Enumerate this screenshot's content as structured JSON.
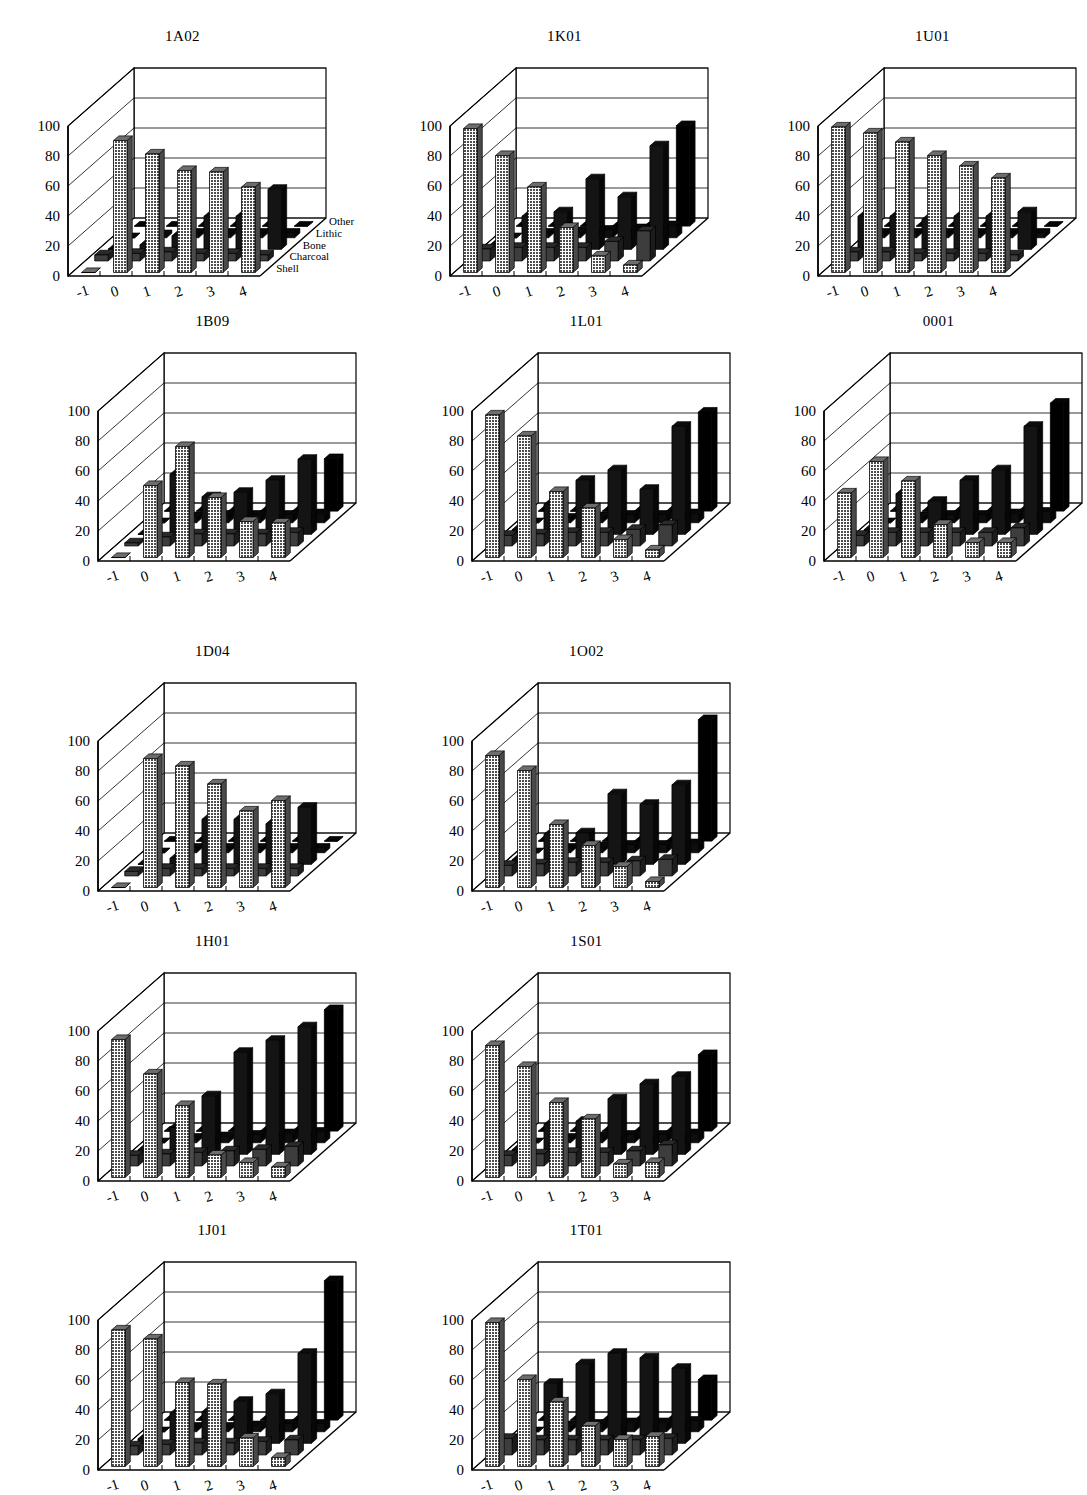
{
  "figure": {
    "kind": "small-multiples-3d-bar-figure",
    "columns": 3,
    "rows": 5,
    "background": "#ffffff",
    "ink": "#000000"
  },
  "axes": {
    "y_ticks": [
      "0",
      "20",
      "40",
      "60",
      "80",
      "100"
    ],
    "y_values": [
      0,
      20,
      40,
      60,
      80,
      100
    ],
    "x_ticks": [
      "-1",
      "0",
      "1",
      "2",
      "3",
      "4"
    ],
    "x_values": [
      -1,
      0,
      1,
      2,
      3,
      4
    ],
    "series_labels": [
      "Other",
      "Lithic",
      "Bone",
      "Charcoal",
      "Shell"
    ],
    "series_order_front_to_back": [
      "Shell",
      "Charcoal",
      "Bone",
      "Lithic",
      "Other"
    ]
  },
  "legend": {
    "visible_on_panel": "1A02",
    "labels": [
      "Other",
      "Lithic",
      "Bone",
      "Charcoal",
      "Shell"
    ]
  },
  "colors": {
    "shell": "#808080",
    "charcoal": "#404040",
    "bone": "#1a1a1a",
    "lithic": "#111111",
    "other": "#000000",
    "panel_line": "#000000",
    "grid_line": "#000000"
  },
  "chart_data": [
    {
      "type": "bar",
      "title": "1A02",
      "xlabel": "",
      "ylabel": "",
      "ylim": [
        0,
        100
      ],
      "categories": [
        "-1",
        "0",
        "1",
        "2",
        "3",
        "4"
      ],
      "series": [
        {
          "name": "Shell",
          "values": [
            0,
            88,
            79,
            68,
            67,
            57
          ]
        },
        {
          "name": "Charcoal",
          "values": [
            4,
            5,
            6,
            5,
            5,
            4
          ]
        },
        {
          "name": "Bone",
          "values": [
            0,
            3,
            9,
            22,
            22,
            40
          ]
        },
        {
          "name": "Lithic",
          "values": [
            0,
            2,
            3,
            3,
            3,
            3
          ]
        },
        {
          "name": "Other",
          "values": [
            0,
            0,
            0,
            0,
            0,
            0
          ]
        }
      ]
    },
    {
      "type": "bar",
      "title": "1K01",
      "xlabel": "",
      "ylabel": "",
      "ylim": [
        0,
        100
      ],
      "categories": [
        "-1",
        "0",
        "1",
        "2",
        "3",
        "4"
      ],
      "series": [
        {
          "name": "Shell",
          "values": [
            96,
            78,
            57,
            30,
            11,
            5
          ]
        },
        {
          "name": "Charcoal",
          "values": [
            8,
            9,
            9,
            9,
            13,
            20
          ]
        },
        {
          "name": "Bone",
          "values": [
            3,
            22,
            25,
            47,
            35,
            69
          ]
        },
        {
          "name": "Lithic",
          "values": [
            0,
            3,
            4,
            5,
            6,
            8
          ]
        },
        {
          "name": "Other",
          "values": [
            0,
            0,
            0,
            0,
            0,
            67
          ]
        }
      ]
    },
    {
      "type": "bar",
      "title": "1U01",
      "xlabel": "",
      "ylabel": "",
      "ylim": [
        0,
        100
      ],
      "categories": [
        "-1",
        "0",
        "1",
        "2",
        "3",
        "4"
      ],
      "series": [
        {
          "name": "Shell",
          "values": [
            97,
            93,
            87,
            78,
            71,
            63
          ]
        },
        {
          "name": "Charcoal",
          "values": [
            6,
            6,
            5,
            5,
            5,
            4
          ]
        },
        {
          "name": "Bone",
          "values": [
            22,
            22,
            20,
            22,
            22,
            25
          ]
        },
        {
          "name": "Lithic",
          "values": [
            3,
            3,
            3,
            3,
            3,
            3
          ]
        },
        {
          "name": "Other",
          "values": [
            0,
            0,
            0,
            0,
            0,
            0
          ]
        }
      ]
    },
    {
      "type": "bar",
      "title": "1B09",
      "xlabel": "",
      "ylabel": "",
      "ylim": [
        0,
        100
      ],
      "categories": [
        "-1",
        "0",
        "1",
        "2",
        "3",
        "4"
      ],
      "series": [
        {
          "name": "Shell",
          "values": [
            0,
            48,
            74,
            40,
            24,
            23
          ]
        },
        {
          "name": "Charcoal",
          "values": [
            2,
            6,
            8,
            8,
            8,
            9
          ]
        },
        {
          "name": "Bone",
          "values": [
            0,
            40,
            25,
            28,
            36,
            50
          ]
        },
        {
          "name": "Lithic",
          "values": [
            0,
            4,
            5,
            5,
            5,
            6
          ]
        },
        {
          "name": "Other",
          "values": [
            0,
            0,
            0,
            0,
            0,
            35
          ]
        }
      ]
    },
    {
      "type": "bar",
      "title": "1L01",
      "xlabel": "",
      "ylabel": "",
      "ylim": [
        0,
        100
      ],
      "categories": [
        "-1",
        "0",
        "1",
        "2",
        "3",
        "4"
      ],
      "series": [
        {
          "name": "Shell",
          "values": [
            95,
            81,
            44,
            33,
            12,
            5
          ]
        },
        {
          "name": "Charcoal",
          "values": [
            7,
            8,
            9,
            9,
            11,
            14
          ]
        },
        {
          "name": "Bone",
          "values": [
            3,
            20,
            36,
            43,
            30,
            72
          ]
        },
        {
          "name": "Lithic",
          "values": [
            0,
            3,
            4,
            5,
            5,
            6
          ]
        },
        {
          "name": "Other",
          "values": [
            0,
            0,
            0,
            0,
            0,
            66
          ]
        }
      ]
    },
    {
      "type": "bar",
      "title": "0001",
      "xlabel": "",
      "ylabel": "",
      "ylim": [
        0,
        100
      ],
      "categories": [
        "-1",
        "0",
        "1",
        "2",
        "3",
        "4"
      ],
      "series": [
        {
          "name": "Shell",
          "values": [
            43,
            64,
            51,
            22,
            10,
            10
          ]
        },
        {
          "name": "Charcoal",
          "values": [
            7,
            9,
            9,
            9,
            9,
            12
          ]
        },
        {
          "name": "Bone",
          "values": [
            3,
            27,
            22,
            36,
            43,
            72
          ]
        },
        {
          "name": "Lithic",
          "values": [
            0,
            4,
            5,
            5,
            6,
            7
          ]
        },
        {
          "name": "Other",
          "values": [
            0,
            0,
            0,
            0,
            0,
            72
          ]
        }
      ]
    },
    {
      "type": "bar",
      "title": "1D04",
      "xlabel": "",
      "ylabel": "",
      "ylim": [
        0,
        100
      ],
      "categories": [
        "-1",
        "0",
        "1",
        "2",
        "3",
        "4"
      ],
      "series": [
        {
          "name": "Shell",
          "values": [
            0,
            86,
            81,
            69,
            51,
            58
          ]
        },
        {
          "name": "Charcoal",
          "values": [
            3,
            5,
            5,
            5,
            5,
            5
          ]
        },
        {
          "name": "Bone",
          "values": [
            0,
            4,
            30,
            30,
            27,
            38
          ]
        },
        {
          "name": "Lithic",
          "values": [
            0,
            3,
            3,
            3,
            3,
            3
          ]
        },
        {
          "name": "Other",
          "values": [
            0,
            0,
            0,
            0,
            0,
            0
          ]
        }
      ]
    },
    {
      "type": "bar",
      "title": "1O02",
      "xlabel": "",
      "ylabel": "",
      "ylim": [
        0,
        100
      ],
      "categories": [
        "-1",
        "0",
        "1",
        "2",
        "3",
        "4"
      ],
      "series": [
        {
          "name": "Shell",
          "values": [
            88,
            78,
            42,
            28,
            14,
            4
          ]
        },
        {
          "name": "Charcoal",
          "values": [
            7,
            8,
            9,
            9,
            10,
            11
          ]
        },
        {
          "name": "Bone",
          "values": [
            3,
            20,
            21,
            47,
            40,
            53
          ]
        },
        {
          "name": "Lithic",
          "values": [
            0,
            3,
            4,
            5,
            5,
            6
          ]
        },
        {
          "name": "Other",
          "values": [
            0,
            0,
            0,
            0,
            0,
            81
          ]
        }
      ]
    },
    {
      "type": "bar",
      "title": "1H01",
      "xlabel": "",
      "ylabel": "",
      "ylim": [
        0,
        100
      ],
      "categories": [
        "-1",
        "0",
        "1",
        "2",
        "3",
        "4"
      ],
      "series": [
        {
          "name": "Shell",
          "values": [
            92,
            69,
            48,
            15,
            10,
            7
          ]
        },
        {
          "name": "Charcoal",
          "values": [
            7,
            8,
            9,
            10,
            11,
            13
          ]
        },
        {
          "name": "Bone",
          "values": [
            3,
            18,
            39,
            68,
            76,
            85
          ]
        },
        {
          "name": "Lithic",
          "values": [
            0,
            3,
            4,
            5,
            6,
            7
          ]
        },
        {
          "name": "Other",
          "values": [
            0,
            0,
            0,
            0,
            0,
            81
          ]
        }
      ]
    },
    {
      "type": "bar",
      "title": "1S01",
      "xlabel": "",
      "ylabel": "",
      "ylim": [
        0,
        100
      ],
      "categories": [
        "-1",
        "0",
        "1",
        "2",
        "3",
        "4"
      ],
      "series": [
        {
          "name": "Shell",
          "values": [
            88,
            74,
            50,
            39,
            9,
            10
          ]
        },
        {
          "name": "Charcoal",
          "values": [
            7,
            8,
            9,
            9,
            10,
            14
          ]
        },
        {
          "name": "Bone",
          "values": [
            3,
            20,
            22,
            37,
            47,
            52
          ]
        },
        {
          "name": "Lithic",
          "values": [
            0,
            3,
            4,
            5,
            5,
            6
          ]
        },
        {
          "name": "Other",
          "values": [
            0,
            0,
            0,
            0,
            0,
            51
          ]
        }
      ]
    },
    {
      "type": "bar",
      "title": "1J01",
      "xlabel": "",
      "ylabel": "",
      "ylim": [
        0,
        100
      ],
      "categories": [
        "-1",
        "0",
        "1",
        "2",
        "3",
        "4"
      ],
      "series": [
        {
          "name": "Shell",
          "values": [
            91,
            85,
            56,
            55,
            19,
            6
          ]
        },
        {
          "name": "Charcoal",
          "values": [
            6,
            7,
            8,
            8,
            9,
            10
          ]
        },
        {
          "name": "Bone",
          "values": [
            3,
            20,
            21,
            28,
            33,
            60
          ]
        },
        {
          "name": "Lithic",
          "values": [
            0,
            3,
            3,
            4,
            5,
            5
          ]
        },
        {
          "name": "Other",
          "values": [
            0,
            0,
            0,
            0,
            0,
            93
          ]
        }
      ]
    },
    {
      "type": "bar",
      "title": "1T01",
      "xlabel": "",
      "ylabel": "",
      "ylim": [
        0,
        100
      ],
      "categories": [
        "-1",
        "0",
        "1",
        "2",
        "3",
        "4"
      ],
      "series": [
        {
          "name": "Shell",
          "values": [
            96,
            58,
            43,
            27,
            18,
            20
          ]
        },
        {
          "name": "Charcoal",
          "values": [
            11,
            10,
            10,
            10,
            10,
            11
          ]
        },
        {
          "name": "Bone",
          "values": [
            3,
            40,
            53,
            60,
            57,
            50
          ]
        },
        {
          "name": "Lithic",
          "values": [
            0,
            4,
            5,
            6,
            6,
            7
          ]
        },
        {
          "name": "Other",
          "values": [
            0,
            0,
            0,
            0,
            0,
            27
          ]
        }
      ]
    }
  ],
  "panel_positions": [
    {
      "title": "1A02",
      "left": 10,
      "top": 28,
      "legend": true
    },
    {
      "title": "1K01",
      "left": 392,
      "top": 28,
      "legend": false
    },
    {
      "title": "1U01",
      "left": 760,
      "top": 28,
      "legend": false
    },
    {
      "title": "1B09",
      "left": 40,
      "top": 313,
      "legend": false
    },
    {
      "title": "1L01",
      "left": 414,
      "top": 313,
      "legend": false
    },
    {
      "title": "0001",
      "left": 766,
      "top": 313,
      "legend": false
    },
    {
      "title": "1D04",
      "left": 40,
      "top": 643,
      "legend": false
    },
    {
      "title": "1O02",
      "left": 414,
      "top": 643,
      "legend": false
    },
    {
      "title": "1H01",
      "left": 40,
      "top": 933,
      "legend": false
    },
    {
      "title": "1S01",
      "left": 414,
      "top": 933,
      "legend": false
    },
    {
      "title": "1J01",
      "left": 40,
      "top": 1222,
      "legend": false
    },
    {
      "title": "1T01",
      "left": 414,
      "top": 1222,
      "legend": false
    }
  ]
}
